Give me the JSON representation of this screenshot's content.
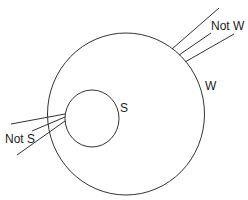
{
  "diagram": {
    "outer_circle": {
      "label": "W",
      "outside_label": "Not W"
    },
    "inner_circle": {
      "label": "S",
      "outside_label": "Not S"
    },
    "colors": {
      "stroke": "#333333",
      "text": "#222222",
      "background": "#ffffff"
    }
  }
}
